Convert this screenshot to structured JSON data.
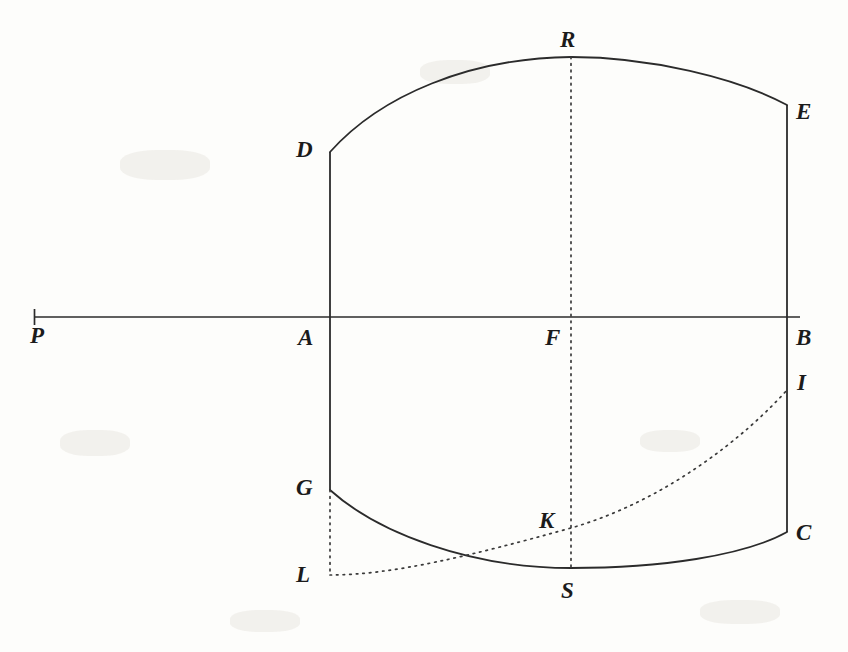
{
  "figure": {
    "background_color": "#fdfdfb",
    "ink_color": "#2b2b2b",
    "canvas": {
      "width": 848,
      "height": 652
    },
    "axis": {
      "name": "horizontal-axis-PB",
      "from_label": "P",
      "to_label": "B",
      "y": 317,
      "x_start": 34,
      "x_end": 800,
      "end_tick": {
        "at": "P",
        "x": 34,
        "height": 16
      }
    },
    "labels": [
      {
        "id": "P",
        "text": "P",
        "x": 30,
        "y": 324,
        "description": "left end of horizontal axis"
      },
      {
        "id": "D",
        "text": "D",
        "x": 296,
        "y": 138,
        "description": "top of left vertical chord"
      },
      {
        "id": "R",
        "text": "R",
        "x": 560,
        "y": 28,
        "description": "apex of upper arc"
      },
      {
        "id": "E",
        "text": "E",
        "x": 796,
        "y": 100,
        "description": "top of right vertical chord"
      },
      {
        "id": "A",
        "text": "A",
        "x": 298,
        "y": 326,
        "description": "axis meets left vertical chord"
      },
      {
        "id": "F",
        "text": "F",
        "x": 545,
        "y": 326,
        "description": "axis meets central dotted vertical"
      },
      {
        "id": "B",
        "text": "B",
        "x": 796,
        "y": 326,
        "description": "right end of horizontal axis"
      },
      {
        "id": "I",
        "text": "I",
        "x": 797,
        "y": 371,
        "description": "upper end of dotted curve on right chord"
      },
      {
        "id": "G",
        "text": "G",
        "x": 296,
        "y": 476,
        "description": "lower end of left vertical chord"
      },
      {
        "id": "K",
        "text": "K",
        "x": 539,
        "y": 509,
        "description": "dotted curve crosses central dotted vertical"
      },
      {
        "id": "C",
        "text": "C",
        "x": 796,
        "y": 521,
        "description": "lower end of right vertical chord"
      },
      {
        "id": "L",
        "text": "L",
        "x": 296,
        "y": 563,
        "description": "foot of dotted vertical below G"
      },
      {
        "id": "S",
        "text": "S",
        "x": 561,
        "y": 579,
        "description": "bottom of lower arc"
      }
    ],
    "vertices": {
      "P": {
        "x": 34,
        "y": 317
      },
      "A": {
        "x": 330,
        "y": 317
      },
      "F": {
        "x": 571,
        "y": 317
      },
      "B": {
        "x": 787,
        "y": 317
      },
      "D": {
        "x": 330,
        "y": 152
      },
      "R": {
        "x": 571,
        "y": 57
      },
      "E": {
        "x": 787,
        "y": 105
      },
      "G": {
        "x": 330,
        "y": 490
      },
      "S": {
        "x": 571,
        "y": 568
      },
      "C": {
        "x": 787,
        "y": 532
      },
      "L": {
        "x": 330,
        "y": 575
      },
      "K": {
        "x": 571,
        "y": 528
      },
      "I": {
        "x": 787,
        "y": 390
      }
    },
    "strokes": [
      {
        "name": "axis-P-to-B",
        "style": "solid",
        "kind": "line"
      },
      {
        "name": "chord-D-A-G",
        "style": "solid",
        "kind": "line",
        "note": "left vertical from D through A to G"
      },
      {
        "name": "chord-E-B-C",
        "style": "solid",
        "kind": "line",
        "note": "right vertical from E through B to C"
      },
      {
        "name": "arc-D-R-E",
        "style": "solid",
        "kind": "curve",
        "note": "upper arc apex at R"
      },
      {
        "name": "arc-G-S-C",
        "style": "solid",
        "kind": "curve",
        "note": "lower arc lowest point at S"
      },
      {
        "name": "dotted-vertical-R-F-S",
        "style": "dotted",
        "kind": "line",
        "note": "central vertical through R, F, K, S"
      },
      {
        "name": "dotted-vertical-G-L",
        "style": "dotted",
        "kind": "line",
        "note": "short vertical from G down to L"
      },
      {
        "name": "dotted-curve-L-K-I",
        "style": "dotted",
        "kind": "curve",
        "note": "rising curve from L through K to I"
      }
    ]
  }
}
